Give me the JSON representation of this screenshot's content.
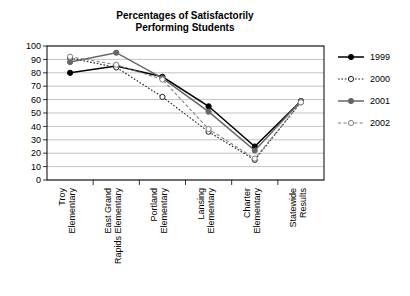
{
  "chart_data": {
    "type": "line",
    "title": "Percentages of Satisfactorily Performing Students",
    "title_lines": [
      "Percentages of Satisfactorily",
      "Performing Students"
    ],
    "xlabel": "",
    "ylabel": "",
    "ylim": [
      0,
      100
    ],
    "yticks": [
      0,
      10,
      20,
      30,
      40,
      50,
      60,
      70,
      80,
      90,
      100
    ],
    "grid": true,
    "legend_position": "right",
    "categories": [
      "Troy Elementary",
      "East Grand Rapids Elementary",
      "Portland Elementary",
      "Lansing Elementary",
      "Charter Elementary",
      "Statewide Results"
    ],
    "category_lines": [
      [
        "Troy",
        "Elementary"
      ],
      [
        "East Grand",
        "Rapids Elementary"
      ],
      [
        "Portland",
        "Elementary"
      ],
      [
        "Lansing",
        "Elementary"
      ],
      [
        "Charter",
        "Elementary"
      ],
      [
        "Statewide",
        "Results"
      ]
    ],
    "series": [
      {
        "name": "1999",
        "values": [
          80,
          85,
          77,
          55,
          25,
          59
        ],
        "color": "#000000",
        "dash": "none",
        "marker": "filled-circle"
      },
      {
        "name": "2000",
        "values": [
          91,
          84,
          62,
          36,
          15,
          58
        ],
        "color": "#1a1a1a",
        "dash": "dotted",
        "marker": "open-circle"
      },
      {
        "name": "2001",
        "values": [
          88,
          95,
          76,
          51,
          22,
          59
        ],
        "color": "#666666",
        "dash": "none",
        "marker": "filled-circle"
      },
      {
        "name": "2002",
        "values": [
          92,
          86,
          75,
          38,
          16,
          58
        ],
        "color": "#808080",
        "dash": "dashed",
        "marker": "open-circle"
      }
    ]
  },
  "legend": {
    "items": [
      {
        "label": "1999"
      },
      {
        "label": "2000"
      },
      {
        "label": "2001"
      },
      {
        "label": "2002"
      }
    ]
  }
}
